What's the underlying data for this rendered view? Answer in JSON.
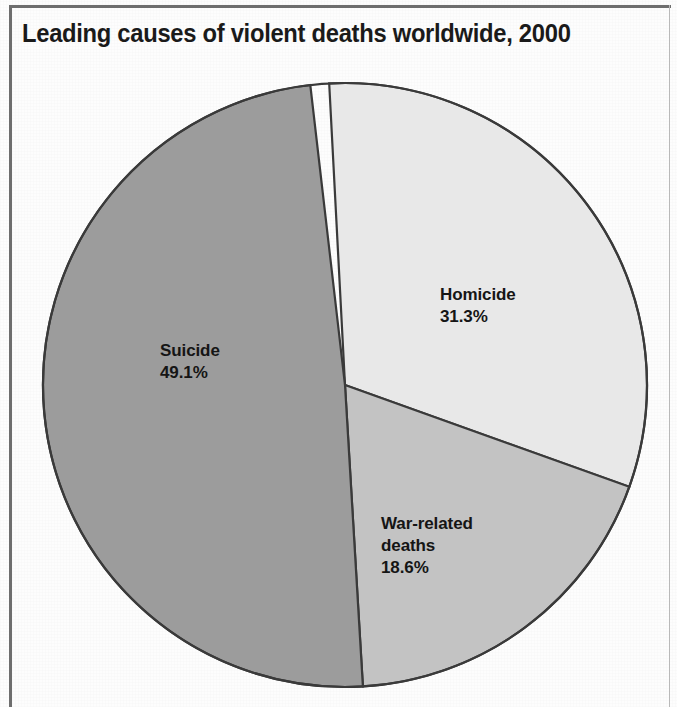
{
  "chart_data": {
    "type": "pie",
    "title": "Leading causes of violent deaths worldwide, 2000",
    "subtitle": "",
    "xlabel": "",
    "ylabel": "",
    "legend_position": "none",
    "grid": false,
    "labels_inside_slices": true,
    "value_unit": "percent",
    "categories": [
      "Homicide",
      "War-related deaths",
      "Suicide"
    ],
    "values": [
      31.3,
      18.6,
      49.1
    ],
    "value_labels": [
      "31.3%",
      "18.6%",
      "49.1%"
    ],
    "slice_colors": [
      "#e8e8e8",
      "#c3c3c3",
      "#9c9c9c"
    ],
    "slices": [
      {
        "name": "Homicide",
        "value": 31.3,
        "value_label": "31.3%",
        "color": "#e8e8e8",
        "start_angle_deg": -3.0,
        "sweep_deg": 112.7
      },
      {
        "name": "War-related deaths",
        "value": 18.6,
        "value_label": "18.6%",
        "color": "#c3c3c3",
        "start_angle_deg": 109.7,
        "sweep_deg": 66.9
      },
      {
        "name": "Suicide",
        "value": 49.1,
        "value_label": "49.1%",
        "color": "#9c9c9c",
        "start_angle_deg": 176.6,
        "sweep_deg": 176.8
      }
    ]
  },
  "figure": {
    "title": "Leading causes of violent deaths worldwide, 2000",
    "frame_color": "#6e6e6e",
    "background": "#fdfdfd",
    "outline_color": "#3a3a3a"
  },
  "labels": {
    "homicide": {
      "name": "Homicide",
      "value": "31.3%"
    },
    "war": {
      "name_line1": "War-related",
      "name_line2": "deaths",
      "value": "18.6%"
    },
    "suicide": {
      "name": "Suicide",
      "value": "49.1%"
    }
  }
}
